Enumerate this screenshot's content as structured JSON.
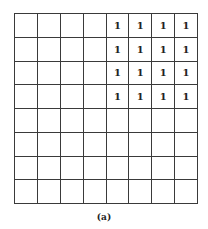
{
  "figure": {
    "caption": "(a)",
    "rows": 8,
    "cols": 8,
    "cells": [
      [
        "",
        "",
        "",
        "",
        "1",
        "1",
        "1",
        "1"
      ],
      [
        "",
        "",
        "",
        "",
        "1",
        "1",
        "1",
        "1"
      ],
      [
        "",
        "",
        "",
        "",
        "1",
        "1",
        "1",
        "1"
      ],
      [
        "",
        "",
        "",
        "",
        "1",
        "1",
        "1",
        "1"
      ],
      [
        "",
        "",
        "",
        "",
        "",
        "",
        "",
        ""
      ],
      [
        "",
        "",
        "",
        "",
        "",
        "",
        "",
        ""
      ],
      [
        "",
        "",
        "",
        "",
        "",
        "",
        "",
        ""
      ],
      [
        "",
        "",
        "",
        "",
        "",
        "",
        "",
        ""
      ]
    ]
  }
}
